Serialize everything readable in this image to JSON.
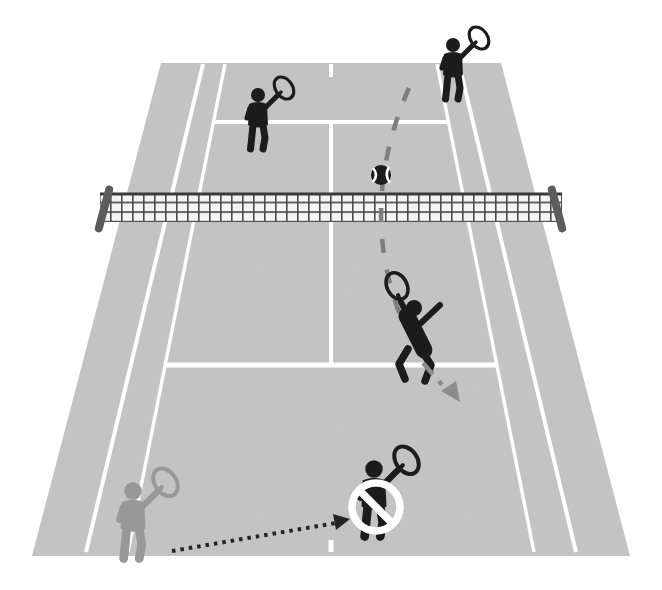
{
  "scene": {
    "kind": "tennis-doubles-smash-vs-lob-diagram",
    "background": "#ffffff"
  },
  "colors": {
    "court": "#c8c8c8",
    "line": "#ffffff",
    "player_dark": "#1c1c1c",
    "player_faded": "#989898",
    "net_cell": "#f4f4f4",
    "net_mesh": "#4b4b4b",
    "net_cord": "#3a3a3a",
    "post": "#5c5c5c",
    "lob": "#7e7e7e",
    "smash_arrow": "#8c8c8c",
    "movement_arrow": "#242424",
    "ball": "#1c1c1c",
    "ball_seam": "#ffffff",
    "prohibition": "#ffffff"
  },
  "court": {
    "surface_points": "161,63 501,63 630,556 32,556",
    "doubles_left": "M 203 64 L 86 552",
    "doubles_right": "M 459 64 L 576 552",
    "singles_left": "M 225 64 L 128 552",
    "singles_right": "M 437 64 L 534 552",
    "service_far": "M 213 122 L 449 122",
    "service_near": "M 165 365 L 497 365",
    "center_service": "M 331 122 L 331 365",
    "center_mark_far": "M 331 64 L 331 77",
    "center_mark_near": "M 331 540 L 331 552"
  },
  "net": {
    "x": "100",
    "y": "193",
    "width": "462",
    "height": "29",
    "cord_path": "M 100 194 L 562 194",
    "left_post_transform": "rotate(15 104 209)",
    "right_post_transform": "rotate(-15 557 209)"
  },
  "ball": {
    "cx": "381",
    "cy": "175",
    "r": "10",
    "seam_left": "M 373 168 Q 379 175 373 182",
    "seam_right": "M 389 167 Q 384 175 390 183"
  },
  "players": {
    "opponent_net": {
      "transform": "translate(258,95)"
    },
    "opponent_baseline": {
      "transform": "translate(453,45)"
    },
    "partner_prohibited": {
      "transform": "translate(374,469) scale(1.25)"
    },
    "partner_faded": {
      "transform": "translate(133,491) scale(1.25)"
    }
  },
  "annotations": {
    "lob_path": "M 409 88 Q 358 205 400 315",
    "smash_line": "M 423 363 L 442 385",
    "smash_head_points": "460,402 456,381 441,391",
    "movement_line": "M 172 551 L 336 523",
    "movement_head_points": "350,519 336,530 333,514",
    "no_circle": {
      "cx": "376",
      "cy": "507",
      "r": "24",
      "slash": "M 359.5 490.5 L 392.5 523.5"
    }
  }
}
